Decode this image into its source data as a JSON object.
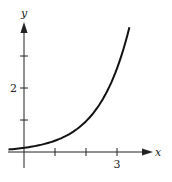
{
  "chart_data": {
    "type": "line",
    "title": "",
    "xlabel": "x",
    "ylabel": "y",
    "x_ticks": [
      1,
      2,
      3
    ],
    "x_tick_labels": [
      "",
      "",
      "3"
    ],
    "y_ticks": [
      1,
      2,
      3
    ],
    "y_tick_labels": [
      "",
      "2",
      ""
    ],
    "xlim": [
      -0.5,
      4.1
    ],
    "ylim": [
      0,
      4.1
    ],
    "grid": false,
    "legend": null,
    "series": [
      {
        "name": "curve",
        "description": "exponential growth, approx y = 0.13 e^x",
        "x": [
          -0.5,
          0,
          0.5,
          1,
          1.5,
          2,
          2.5,
          3,
          3.2,
          3.4
        ],
        "y": [
          0.08,
          0.13,
          0.21,
          0.35,
          0.58,
          0.96,
          1.58,
          2.61,
          3.19,
          3.9
        ]
      }
    ],
    "colors": {
      "axis": "#222222",
      "curve": "#111111"
    }
  }
}
